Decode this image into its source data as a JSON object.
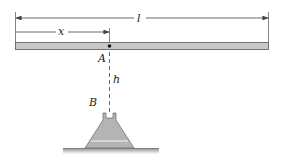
{
  "diagram": {
    "labels": {
      "length": "l",
      "distance": "x",
      "point_a": "A",
      "height": "h",
      "support_b": "B"
    },
    "colors": {
      "bar_fill": "#c8c8c8",
      "bar_stroke": "#555555",
      "support_fill": "#b4b4b4",
      "ground": "#999999",
      "line": "#444444"
    }
  }
}
